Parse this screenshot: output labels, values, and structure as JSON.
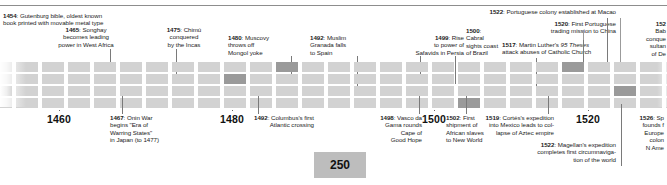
{
  "figure": {
    "scale_badge": "250",
    "colors": {
      "cell": "#d2d2d2",
      "cell_highlight": "#9a9a9a",
      "rule": "#8d8d8d",
      "text": "#1b1b1b",
      "badge_bg": "#bdbdbd"
    }
  },
  "axis": {
    "years": [
      {
        "label": "1460",
        "x": 59
      },
      {
        "label": "1480",
        "x": 232
      },
      {
        "label": "1500",
        "x": 434
      },
      {
        "label": "1520",
        "x": 588
      }
    ]
  },
  "events_above": [
    {
      "year": "1454",
      "text": ": Gutenburg bible, oldest known book printed with movable metal type",
      "full": "1454: Gutenburg bible, oldest known book printed with movable metal type"
    },
    {
      "year": "1465",
      "text": ": Songhay becomes leading power in West Africa",
      "full": "1465: Songhay becomes leading power in West Africa"
    },
    {
      "year": "1475",
      "text": ": Chimú conquered by the Incas",
      "full": "1475: Chimú conquered by the Incas"
    },
    {
      "year": "1480",
      "text": ": Muscovy throws off Mongol yoke",
      "full": "1480: Muscovy throws off Mongol yoke"
    },
    {
      "year": "1492",
      "text": ": Muslim Granada falls to Spain",
      "full": "1492: Muslim Granada falls to Spain"
    },
    {
      "year": "1499",
      "text": ": Rise to power of Safavids in Persia",
      "full": "1499: Rise to power of Safavids in Persia"
    },
    {
      "year": "1500",
      "text": ": Cabral sights coast of Brazil",
      "full": "1500: Cabral sights coast of Brazil"
    },
    {
      "year": "1517",
      "text": ": Martin Luther's 95 Theses attack abuses of Catholic Church",
      "full": "1517: Martin Luther's 95 Theses attack abuses of Catholic Church"
    },
    {
      "year": "1520",
      "text": ": First Portuguese trading mission to China",
      "full": "1520: First Portuguese trading mission to China"
    },
    {
      "year": "1522",
      "text": ": Portuguese colony established at Macao",
      "full": "1522: Portuguese colony established at Macao"
    },
    {
      "year": "152",
      "text": ": Bab... conque... sultan... of De...",
      "full": "1526: Babur conquers sultanate of Delhi"
    }
  ],
  "events_below": [
    {
      "year": "1467",
      "text": ": Onin War begins \"Era of Warring States\" in Japan (to 1477)",
      "full": "1467: Onin War begins \"Era of Warring States\" in Japan (to 1477)"
    },
    {
      "year": "1492",
      "text": ": Columbus's first Atlantic crossing",
      "full": "1492: Columbus's first Atlantic crossing"
    },
    {
      "year": "1498",
      "text": ": Vasco da Gama rounds Cape of Good Hope",
      "full": "1498: Vasco da Gama rounds Cape of Good Hope"
    },
    {
      "year": "1502",
      "text": ": First shipment of African slaves to New World",
      "full": "1502: First shipment of African slaves to New World"
    },
    {
      "year": "1519",
      "text": ": Cortés's expedition into Mexico leads to collapse of Aztec empire",
      "full": "1519: Cortés's expedition into Mexico leads to collapse of Aztec empire"
    },
    {
      "year": "1522",
      "text": ": Magellan's expedition completes first circumnavigation of the world",
      "full": "1522: Magellan's expedition completes first circumnavigation of the world"
    },
    {
      "year": "1526",
      "text": ": Sp... founds f... Europe... colon... N Ame...",
      "full": "1526: Spain founds first European colony in N America"
    }
  ],
  "notes_markup": {
    "n1454": "<b>1454</b>: Gutenburg bible, oldest known<br>book printed with movable metal type",
    "n1465": "<b>1465</b>: Songhay<br>becomes leading<br>power in West Africa",
    "n1475": "<b>1475</b>: Chimú<br>conquered<br>by the Incas",
    "n1480": "<b>1480</b>: Muscovy<br>throws off<br>Mongol yoke",
    "n1492a": "<b>1492</b>: Muslim<br>Granada falls<br>to Spain",
    "n1499": "<b>1499</b>: Rise<br>to power of<br>Safavids in Persia",
    "n1500": "<b>1500</b>:<br>Cabral<br>sights coast<br>of Brazil",
    "n1517": "<b>1517</b>: Martin Luther's <i>95 Theses</i><br>attack abuses of Catholic Church",
    "n1520": "<b>1520</b>: First Portuguese<br>trading mission to China",
    "n1522a": "<b>1522</b>: Portuguese colony established at Macao",
    "n1526a": "<b>152</b><br>Bab<br>conque<br>sultan<br>of De",
    "n1467": "<b>1467</b>: Onin War<br>begins \"Era of<br>Warring States\"<br>in Japan (to 1477)",
    "n1492b": "<b>1492</b>: Columbus's first<br>Atlantic crossing",
    "n1498": "<b>1498</b>: Vasco da<br>Gama rounds<br>Cape of<br>Good Hope",
    "n1502": "<b>1502</b>: First<br>shipment of<br>African slaves<br>to New World",
    "n1519": "<b>1519</b>: Cortés's expedition<br>into Mexico leads to col-<br>lapse of Aztec empire",
    "n1522b": "<b>1522</b>: Magellan's expedition<br>completes first circumnaviga-<br>tion of the world",
    "n1526b": "<b>1526</b>: Sp<br>founds f<br>Europe<br>colon<br>N Ame"
  },
  "grid": {
    "cell_width": 22,
    "cell_gap": 4,
    "row_height": 10,
    "row_gap": 2,
    "rows": 4,
    "columns": 26,
    "highlighted": [
      {
        "row": 0,
        "col": 11
      },
      {
        "row": 0,
        "col": 38
      },
      {
        "row": 0,
        "col": 22
      },
      {
        "row": 1,
        "col": 9
      },
      {
        "row": 2,
        "col": 0
      },
      {
        "row": 2,
        "col": 24
      },
      {
        "row": 3,
        "col": 18
      }
    ]
  }
}
